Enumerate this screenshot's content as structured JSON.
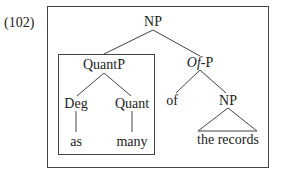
{
  "example_number": "(102)",
  "tree": {
    "root": {
      "label": "NP"
    },
    "quantp": {
      "label": "QuantP",
      "boxed": true
    },
    "deg": {
      "label": "Deg",
      "word": "as"
    },
    "quant": {
      "label": "Quant",
      "word": "many"
    },
    "ofp": {
      "label_italic": "Of",
      "label_rest": "-P"
    },
    "of": {
      "label": "of"
    },
    "np2": {
      "label": "NP",
      "triangle_text": "the records"
    }
  },
  "colors": {
    "line": "#444444",
    "text": "#222222",
    "background": "#ffffff"
  }
}
